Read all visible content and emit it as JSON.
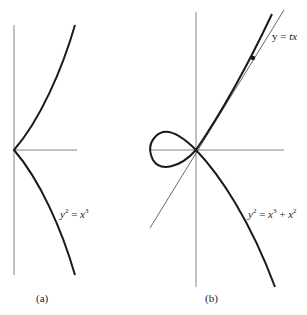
{
  "figure_a": {
    "caption": "(a)",
    "equation": {
      "lhs_var": "y",
      "lhs_exp": "2",
      "eq": " = ",
      "rhs_var": "x",
      "rhs_exp": "3"
    }
  },
  "figure_b": {
    "caption": "(b)",
    "equation": {
      "lhs_var": "y",
      "lhs_exp": "2",
      "eq": " = ",
      "t1_var": "x",
      "t1_exp": "3",
      "plus": " + ",
      "t2_var": "x",
      "t2_exp": "2"
    },
    "line_label": {
      "prefix": "y = ",
      "var": "tx"
    }
  },
  "colors": {
    "curve": "#1a1a1a",
    "axis": "#555555",
    "line": "#444444"
  }
}
